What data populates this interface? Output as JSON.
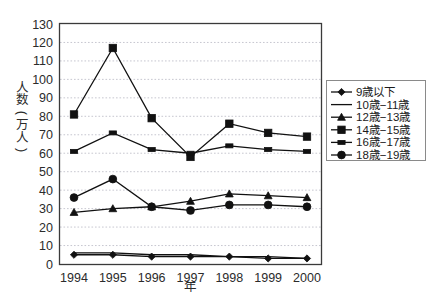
{
  "chart_data": {
    "type": "line",
    "title": "",
    "xlabel": "年",
    "ylabel": "人数(万人)",
    "categories": [
      "1994",
      "1995",
      "1996",
      "1997",
      "1998",
      "1999",
      "2000"
    ],
    "ylim": [
      0,
      130
    ],
    "ytick_step": 10,
    "yticks": [
      "0",
      "10",
      "20",
      "30",
      "40",
      "50",
      "60",
      "70",
      "80",
      "90",
      "100",
      "110",
      "120",
      "130"
    ],
    "grid": "horizontal-dotted",
    "legend_position": "right",
    "series": [
      {
        "name": "9歳以下",
        "marker": "diamond",
        "values": [
          5,
          5,
          4,
          4,
          4,
          3,
          3
        ]
      },
      {
        "name": "10歳−11歳",
        "marker": "none",
        "values": [
          6,
          6,
          5,
          5,
          4,
          4,
          3
        ]
      },
      {
        "name": "12歳−13歳",
        "marker": "triangle",
        "values": [
          28,
          30,
          31,
          34,
          38,
          37,
          36
        ]
      },
      {
        "name": "14歳−15歳",
        "marker": "square",
        "values": [
          81,
          117,
          79,
          58,
          76,
          71,
          69
        ]
      },
      {
        "name": "16歳−17歳",
        "marker": "wide-square",
        "values": [
          61,
          71,
          62,
          60,
          64,
          62,
          61
        ]
      },
      {
        "name": "18歳−19歳",
        "marker": "circle",
        "values": [
          36,
          46,
          31,
          29,
          32,
          32,
          31
        ]
      }
    ]
  },
  "colors": {
    "ink": "#111111",
    "frame": "#3a3a3a",
    "grid": "#b9b9c4",
    "background": "#ffffff"
  }
}
